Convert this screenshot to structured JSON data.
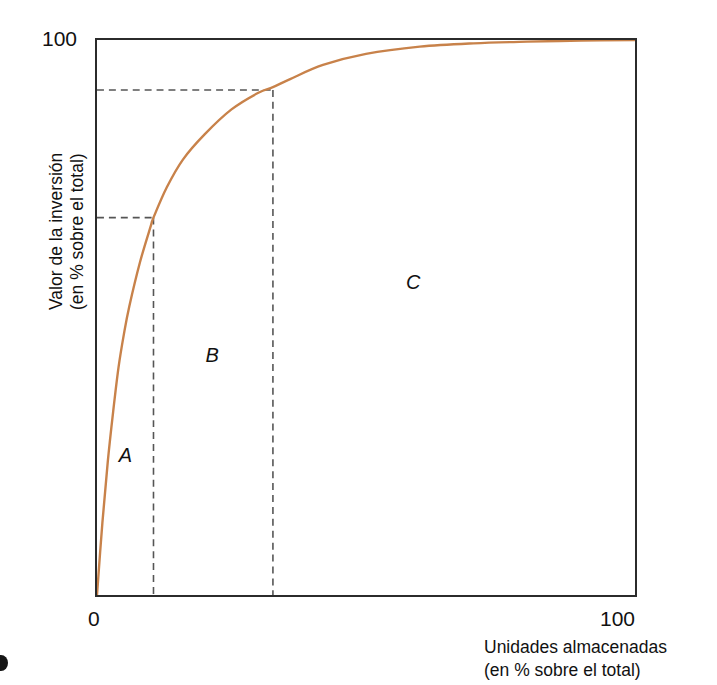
{
  "chart_data": {
    "type": "line",
    "title": "",
    "subtitle": "",
    "xlabel": "Unidades almacenadas (en % sobre el total)",
    "ylabel": "Valor de la inversión (en % sobre el total)",
    "xlabel_lines": [
      "Unidades almacenadas",
      "(en % sobre el total)"
    ],
    "ylabel_lines": [
      "Valor de la inversión",
      "(en % sobre el total)"
    ],
    "xlim": [
      0,
      100
    ],
    "ylim": [
      0,
      100
    ],
    "xticks": [
      "0",
      "100"
    ],
    "yticks": [
      "100"
    ],
    "grid": false,
    "legend": false,
    "series": [
      {
        "name": "Curva ABC / Pareto",
        "color": "#c8824a",
        "x": [
          0,
          1,
          2,
          3,
          4,
          5,
          6,
          8,
          10,
          10.5,
          13,
          16,
          20,
          25,
          30,
          32.7,
          36,
          42,
          50,
          60,
          70,
          80,
          90,
          100
        ],
        "y": [
          0,
          13,
          24,
          33,
          41,
          47,
          52,
          60,
          66.5,
          68,
          73.5,
          78.5,
          83,
          87.5,
          90.5,
          91.5,
          93,
          95.5,
          97.5,
          98.8,
          99.4,
          99.7,
          99.9,
          100
        ]
      }
    ],
    "annotations": [
      {
        "label": "A",
        "x": 5.5,
        "y": 25,
        "style": "italic"
      },
      {
        "label": "B",
        "x": 21.5,
        "y": 43,
        "style": "italic"
      },
      {
        "label": "C",
        "x": 58.5,
        "y": 56,
        "style": "italic"
      }
    ],
    "guides": [
      {
        "name": "cut-a-b",
        "x": 10.5,
        "y": 68,
        "style": "dashed",
        "color": "#555555"
      },
      {
        "name": "cut-b-c",
        "x": 32.7,
        "y": 91,
        "style": "dashed",
        "color": "#555555"
      }
    ]
  },
  "axes": {
    "y_tick_top": "100",
    "x_tick_left": "0",
    "x_tick_right": "100",
    "y_title_line1": "Valor de la inversión",
    "y_title_line2": "(en % sobre el total)",
    "x_title_line1": "Unidades almacenadas",
    "x_title_line2": "(en % sobre el total)"
  },
  "regions": {
    "a": "A",
    "b": "B",
    "c": "C"
  },
  "colors": {
    "curve": "#c8824a",
    "frame": "#2b2b2b",
    "guide": "#555555",
    "text": "#111111",
    "background": "#ffffff"
  }
}
